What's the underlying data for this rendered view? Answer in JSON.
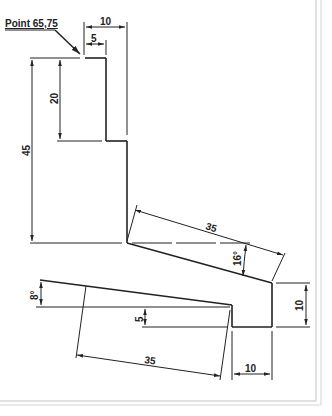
{
  "drawing": {
    "callout": {
      "label": "Point 65,75"
    },
    "dimensions": {
      "top_width_outer": "10",
      "top_width_inner": "5",
      "upper_height": "20",
      "total_height": "45",
      "slant_length_upper": "35",
      "angle_upper": "16°",
      "angle_lower": "8°",
      "step_height": "5",
      "right_height": "10",
      "slant_length_lower": "35",
      "bottom_width": "10"
    },
    "colors": {
      "line": "#222222",
      "frame": "#d8d8d8",
      "background": "#ffffff"
    }
  }
}
